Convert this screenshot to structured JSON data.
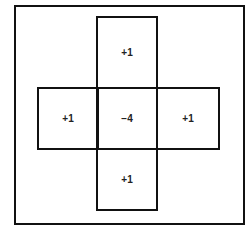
{
  "diagram": {
    "type": "laplacian-kernel-stencil",
    "cells": {
      "top": "+1",
      "left": "+1",
      "center": "−4",
      "right": "+1",
      "bottom": "+1"
    },
    "colors": {
      "line": "#111111",
      "text": "#222222",
      "background": "#ffffff"
    }
  }
}
